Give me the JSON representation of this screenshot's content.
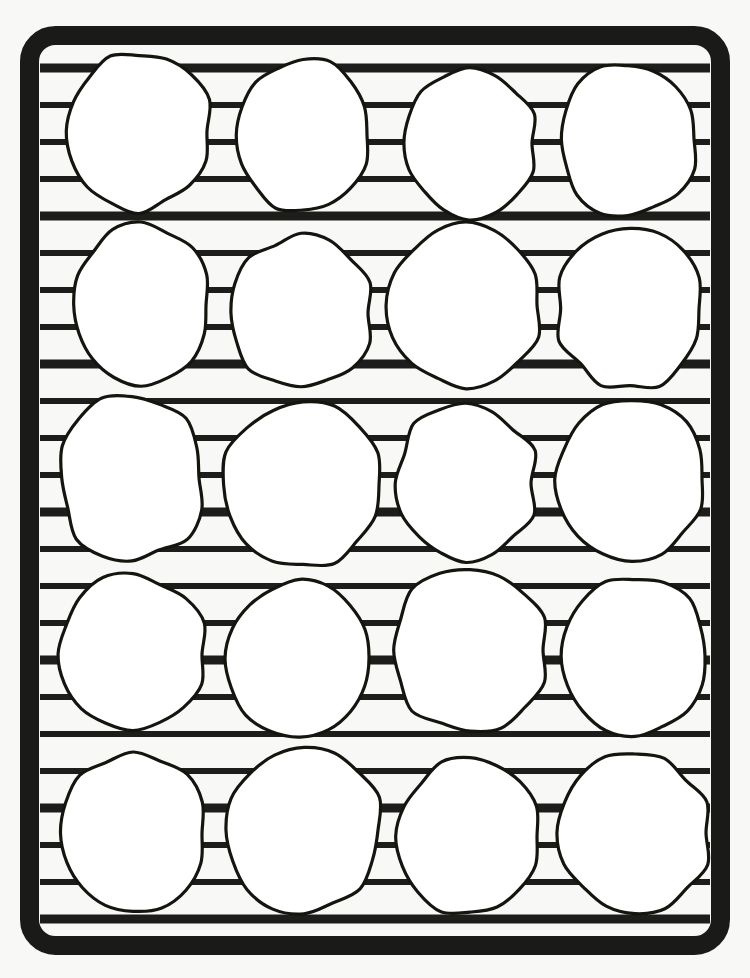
{
  "scene": {
    "title": "Cooling rack with cookies",
    "description": "Line drawing of a rectangular wire cooling rack holding twenty round cookies arranged in five rows of four",
    "width": 750,
    "height": 978,
    "background_color": "#f8f8f6"
  },
  "colors": {
    "background": "#f8f8f6",
    "frame_stroke": "#1a1a18",
    "bar_stroke": "#1d1d1b",
    "cookie_fill": "#ffffff",
    "cookie_stroke": "#15150f"
  },
  "rack": {
    "name": "cooling-rack",
    "frame": {
      "x": 20,
      "y": 26,
      "width": 710,
      "height": 929,
      "corner_radius": 26,
      "stroke_width": 19
    },
    "inner": {
      "x": 40,
      "y": 46,
      "width": 670,
      "height": 889
    },
    "bars": {
      "count": 24,
      "orientation": "horizontal",
      "x_start": 40,
      "x_end": 710,
      "spacing": 37,
      "first_y": 68,
      "thickness_major": 9,
      "thickness_minor": 6,
      "y_positions": [
        68,
        105,
        142,
        179,
        216,
        253,
        290,
        327,
        364,
        401,
        438,
        475,
        512,
        549,
        586,
        623,
        660,
        697,
        734,
        771,
        808,
        845,
        882,
        919
      ],
      "major_indices": [
        0,
        4,
        8,
        12,
        16,
        20,
        23
      ]
    }
  },
  "cookies": {
    "name": "cookie-grid",
    "rows": 5,
    "columns": 4,
    "total": 20,
    "stroke_width": 3.2,
    "items": [
      {
        "id": "cookie-r1-c1",
        "row": 1,
        "col": 1,
        "cx": 139,
        "cy": 131,
        "rx": 73,
        "ry": 79,
        "wobble": 5,
        "seed": 11
      },
      {
        "id": "cookie-r1-c2",
        "row": 1,
        "col": 2,
        "cx": 303,
        "cy": 135,
        "rx": 68,
        "ry": 76,
        "wobble": 4,
        "seed": 27
      },
      {
        "id": "cookie-r1-c3",
        "row": 1,
        "col": 3,
        "cx": 469,
        "cy": 143,
        "rx": 68,
        "ry": 73,
        "wobble": 5,
        "seed": 43
      },
      {
        "id": "cookie-r1-c4",
        "row": 1,
        "col": 4,
        "cx": 628,
        "cy": 139,
        "rx": 70,
        "ry": 77,
        "wobble": 4,
        "seed": 59
      },
      {
        "id": "cookie-r2-c1",
        "row": 2,
        "col": 1,
        "cx": 141,
        "cy": 305,
        "rx": 70,
        "ry": 78,
        "wobble": 5,
        "seed": 71
      },
      {
        "id": "cookie-r2-c2",
        "row": 2,
        "col": 2,
        "cx": 301,
        "cy": 313,
        "rx": 71,
        "ry": 76,
        "wobble": 4,
        "seed": 83
      },
      {
        "id": "cookie-r2-c3",
        "row": 2,
        "col": 3,
        "cx": 466,
        "cy": 305,
        "rx": 76,
        "ry": 82,
        "wobble": 5,
        "seed": 97
      },
      {
        "id": "cookie-r2-c4",
        "row": 2,
        "col": 4,
        "cx": 630,
        "cy": 309,
        "rx": 73,
        "ry": 80,
        "wobble": 4,
        "seed": 109
      },
      {
        "id": "cookie-r3-c1",
        "row": 3,
        "col": 1,
        "cx": 132,
        "cy": 478,
        "rx": 73,
        "ry": 81,
        "wobble": 6,
        "seed": 127
      },
      {
        "id": "cookie-r3-c2",
        "row": 3,
        "col": 2,
        "cx": 303,
        "cy": 485,
        "rx": 80,
        "ry": 83,
        "wobble": 4,
        "seed": 139
      },
      {
        "id": "cookie-r3-c3",
        "row": 3,
        "col": 3,
        "cx": 466,
        "cy": 483,
        "rx": 70,
        "ry": 80,
        "wobble": 5,
        "seed": 151
      },
      {
        "id": "cookie-r3-c4",
        "row": 3,
        "col": 4,
        "cx": 632,
        "cy": 479,
        "rx": 75,
        "ry": 79,
        "wobble": 5,
        "seed": 163
      },
      {
        "id": "cookie-r4-c1",
        "row": 4,
        "col": 1,
        "cx": 133,
        "cy": 654,
        "rx": 74,
        "ry": 78,
        "wobble": 5,
        "seed": 179
      },
      {
        "id": "cookie-r4-c2",
        "row": 4,
        "col": 2,
        "cx": 300,
        "cy": 658,
        "rx": 73,
        "ry": 77,
        "wobble": 4,
        "seed": 191
      },
      {
        "id": "cookie-r4-c3",
        "row": 4,
        "col": 3,
        "cx": 470,
        "cy": 650,
        "rx": 78,
        "ry": 82,
        "wobble": 5,
        "seed": 211
      },
      {
        "id": "cookie-r4-c4",
        "row": 4,
        "col": 4,
        "cx": 635,
        "cy": 656,
        "rx": 74,
        "ry": 78,
        "wobble": 4,
        "seed": 223
      },
      {
        "id": "cookie-r5-c1",
        "row": 5,
        "col": 1,
        "cx": 133,
        "cy": 833,
        "rx": 74,
        "ry": 80,
        "wobble": 5,
        "seed": 239
      },
      {
        "id": "cookie-r5-c2",
        "row": 5,
        "col": 2,
        "cx": 304,
        "cy": 830,
        "rx": 78,
        "ry": 82,
        "wobble": 4,
        "seed": 251
      },
      {
        "id": "cookie-r5-c3",
        "row": 5,
        "col": 3,
        "cx": 470,
        "cy": 836,
        "rx": 72,
        "ry": 78,
        "wobble": 5,
        "seed": 269
      },
      {
        "id": "cookie-r5-c4",
        "row": 5,
        "col": 4,
        "cx": 635,
        "cy": 833,
        "rx": 75,
        "ry": 79,
        "wobble": 4,
        "seed": 281
      }
    ]
  }
}
